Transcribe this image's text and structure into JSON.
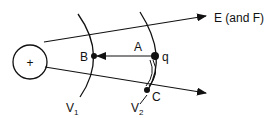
{
  "diagram": {
    "charge_sign": "+",
    "field_label": "E (and F)",
    "points": {
      "A": "A",
      "B": "B",
      "C": "C",
      "q": "q"
    },
    "equipotentials": [
      {
        "label": "V",
        "subscript": "1"
      },
      {
        "label": "V",
        "subscript": "2"
      }
    ]
  }
}
